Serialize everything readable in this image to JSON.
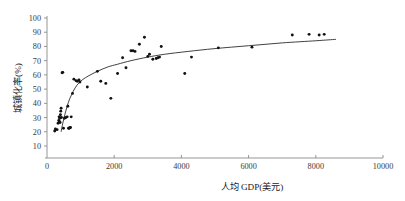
{
  "chart_data": {
    "type": "scatter",
    "title": "",
    "xlabel": "人均 GDP(美元)",
    "ylabel": "城镇化率(%)",
    "xlim": [
      0,
      10000
    ],
    "ylim": [
      0,
      100
    ],
    "xticks": [
      0,
      2000,
      4000,
      6000,
      8000,
      10000
    ],
    "xtick_labels": [
      "0",
      "2000",
      "4000",
      "6000",
      "8000",
      "10000"
    ],
    "yticks": [
      10,
      20,
      30,
      40,
      50,
      60,
      70,
      80,
      90,
      100
    ],
    "ytick_labels": [
      "10",
      "20",
      "30",
      "40",
      "50",
      "60",
      "70",
      "80",
      "90",
      "100"
    ],
    "grid": false,
    "legend": false,
    "legend_position": "none",
    "series": [
      {
        "name": "省份样本",
        "marker": "dot",
        "color": "#111111",
        "points": [
          [
            230,
            20.5
          ],
          [
            250,
            22.0
          ],
          [
            300,
            21.5
          ],
          [
            330,
            26.0
          ],
          [
            350,
            28.0
          ],
          [
            360,
            30.5
          ],
          [
            370,
            27.0
          ],
          [
            380,
            29.5
          ],
          [
            390,
            26.5
          ],
          [
            400,
            32.0
          ],
          [
            410,
            34.5
          ],
          [
            420,
            36.5
          ],
          [
            430,
            30.0
          ],
          [
            450,
            61.5
          ],
          [
            470,
            61.8
          ],
          [
            490,
            22.5
          ],
          [
            520,
            29.5
          ],
          [
            560,
            30.0
          ],
          [
            600,
            30.5
          ],
          [
            620,
            38.0
          ],
          [
            640,
            22.5
          ],
          [
            660,
            22.5
          ],
          [
            680,
            22.8
          ],
          [
            700,
            23.0
          ],
          [
            720,
            30.5
          ],
          [
            760,
            47.0
          ],
          [
            800,
            57.0
          ],
          [
            860,
            56.0
          ],
          [
            900,
            55.5
          ],
          [
            950,
            56.5
          ],
          [
            980,
            55.0
          ],
          [
            1200,
            51.5
          ],
          [
            1500,
            62.5
          ],
          [
            1600,
            55.5
          ],
          [
            1750,
            54.0
          ],
          [
            1900,
            43.5
          ],
          [
            2100,
            61.0
          ],
          [
            2250,
            72.0
          ],
          [
            2350,
            65.0
          ],
          [
            2500,
            77.0
          ],
          [
            2560,
            77.0
          ],
          [
            2620,
            76.5
          ],
          [
            2750,
            81.5
          ],
          [
            2900,
            86.5
          ],
          [
            3000,
            73.0
          ],
          [
            3050,
            74.5
          ],
          [
            3150,
            71.0
          ],
          [
            3250,
            71.5
          ],
          [
            3300,
            72.0
          ],
          [
            3350,
            72.5
          ],
          [
            3400,
            80.0
          ],
          [
            4100,
            61.0
          ],
          [
            4300,
            72.5
          ],
          [
            5100,
            79.0
          ],
          [
            6100,
            79.5
          ],
          [
            7300,
            88.0
          ],
          [
            7800,
            88.5
          ],
          [
            8100,
            88.0
          ],
          [
            8250,
            88.5
          ]
        ]
      }
    ],
    "fit_curve": {
      "name": "拟合曲线",
      "color": "#202020",
      "points": [
        [
          420,
          20.0
        ],
        [
          470,
          26.0
        ],
        [
          530,
          32.0
        ],
        [
          600,
          38.0
        ],
        [
          680,
          43.5
        ],
        [
          780,
          48.5
        ],
        [
          900,
          53.0
        ],
        [
          1050,
          56.5
        ],
        [
          1250,
          59.5
        ],
        [
          1500,
          62.5
        ],
        [
          1800,
          65.5
        ],
        [
          2100,
          67.5
        ],
        [
          2500,
          70.0
        ],
        [
          3000,
          72.5
        ],
        [
          3500,
          74.5
        ],
        [
          4200,
          76.5
        ],
        [
          5000,
          78.5
        ],
        [
          6000,
          80.5
        ],
        [
          7000,
          82.5
        ],
        [
          8000,
          84.0
        ],
        [
          8600,
          85.0
        ]
      ]
    }
  }
}
